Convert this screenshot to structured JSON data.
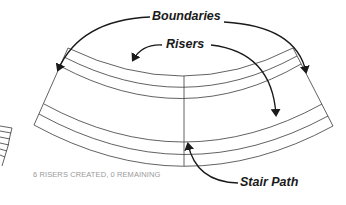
{
  "diagram": {
    "type": "curved-stair-annotation",
    "labels": {
      "boundaries": "Boundaries",
      "risers": "Risers",
      "stair_path": "Stair Path"
    },
    "status_text": "6 RISERS CREATED, 0 REMAINING",
    "colors": {
      "line": "#3a3a3a",
      "arrow": "#1a1a1a",
      "status": "#9a9a9a",
      "background": "#ffffff"
    },
    "riser_count": 6,
    "remaining": 0
  }
}
